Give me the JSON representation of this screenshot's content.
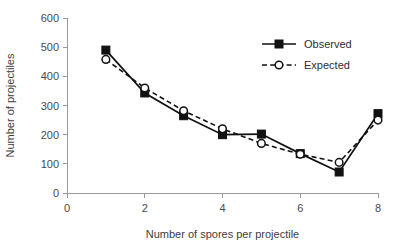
{
  "chart_data": {
    "type": "line",
    "title": "",
    "xlabel": "Number of spores per projectile",
    "ylabel": "Number of projectiles",
    "x": [
      1,
      2,
      3,
      4,
      5,
      6,
      7,
      8
    ],
    "xlim": [
      0,
      8
    ],
    "ylim": [
      0,
      600
    ],
    "xticks": [
      0,
      2,
      4,
      6,
      8
    ],
    "yticks": [
      0,
      100,
      200,
      300,
      400,
      500,
      600
    ],
    "xtick_labels": [
      "0",
      "2",
      "4",
      "6",
      "8"
    ],
    "ytick_labels": [
      "0",
      "100",
      "200",
      "300",
      "400",
      "500",
      "600"
    ],
    "grid": false,
    "legend_position": "upper right",
    "series": [
      {
        "name": "Observed",
        "marker": "filled-square",
        "linestyle": "solid",
        "color": "#111111",
        "values": [
          490,
          343,
          265,
          200,
          202,
          135,
          72,
          272
        ]
      },
      {
        "name": "Expected",
        "marker": "open-circle",
        "linestyle": "dashed",
        "color": "#111111",
        "values": [
          458,
          360,
          282,
          220,
          170,
          133,
          105,
          250
        ]
      }
    ]
  },
  "legend": {
    "entries": [
      {
        "label": "Observed"
      },
      {
        "label": "Expected"
      }
    ]
  },
  "axes": {
    "x_title": "Number of spores per projectile",
    "y_title": "Number of projectiles"
  }
}
